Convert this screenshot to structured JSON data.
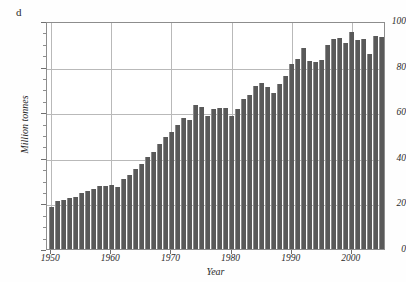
{
  "panel": {
    "label": "d"
  },
  "chart_data": {
    "type": "bar",
    "title": "",
    "xlabel": "Year",
    "ylabel": "Million tonnes",
    "xlim": [
      1949.3,
      2005.7
    ],
    "ylim": [
      0,
      100
    ],
    "grid": true,
    "legend": null,
    "y_major_ticks": [
      0,
      20,
      40,
      60,
      80,
      100
    ],
    "y_minor_tick_step": 5,
    "y_tick_labels": [
      "0",
      "20",
      "40",
      "60",
      "80",
      "100"
    ],
    "x_major_ticks": [
      1950,
      1960,
      1970,
      1980,
      1990,
      2000
    ],
    "x_tick_labels": [
      "1950",
      "1960",
      "1970",
      "1980",
      "1990",
      "2000"
    ],
    "bar_color": "#595959",
    "bar_edge_color": "#8a8a8a",
    "grid_color": "#b9b9b9",
    "axis_color": "#8d8d8d",
    "categories": [
      1950,
      1951,
      1952,
      1953,
      1954,
      1955,
      1956,
      1957,
      1958,
      1959,
      1960,
      1961,
      1962,
      1963,
      1964,
      1965,
      1966,
      1967,
      1968,
      1969,
      1970,
      1971,
      1972,
      1973,
      1974,
      1975,
      1976,
      1977,
      1978,
      1979,
      1980,
      1981,
      1982,
      1983,
      1984,
      1985,
      1986,
      1987,
      1988,
      1989,
      1990,
      1991,
      1992,
      1993,
      1994,
      1995,
      1996,
      1997,
      1998,
      1999,
      2000,
      2001,
      2002,
      2003,
      2004,
      2005
    ],
    "values": [
      18.5,
      21.0,
      21.5,
      22.5,
      23.0,
      24.5,
      25.5,
      26.5,
      27.5,
      27.5,
      28.0,
      27.0,
      30.5,
      32.5,
      35.0,
      37.5,
      40.5,
      42.5,
      46.0,
      49.0,
      51.5,
      54.5,
      57.5,
      56.5,
      63.0,
      62.5,
      58.5,
      61.5,
      62.0,
      62.0,
      58.5,
      61.5,
      66.0,
      67.5,
      71.5,
      73.0,
      71.0,
      68.5,
      72.5,
      76.0,
      81.0,
      83.5,
      88.0,
      82.5,
      82.0,
      83.0,
      89.5,
      92.0,
      92.5,
      90.5,
      95.0,
      91.5,
      92.0,
      85.5,
      93.5,
      93.0
    ]
  }
}
